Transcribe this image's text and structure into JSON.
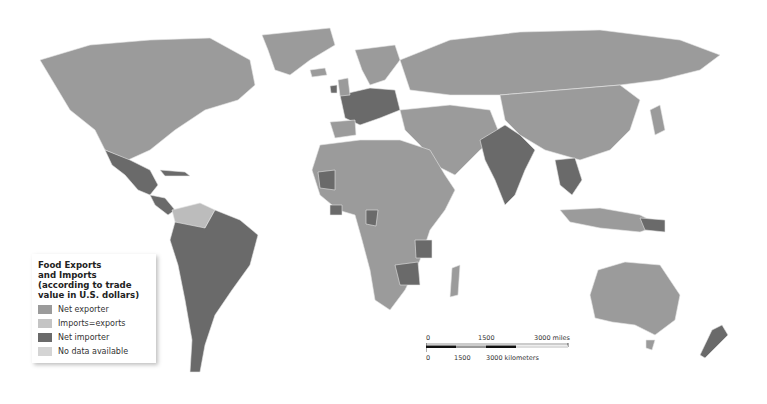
{
  "map": {
    "type": "choropleth world map",
    "colors": {
      "net_exporter": "#9b9b9b",
      "imports_equal_exports": "#c4c4c4",
      "net_importer": "#6a6a6a",
      "no_data": "#d4d4d4",
      "ocean": "#ffffff"
    }
  },
  "legend": {
    "title_line1": "Food Exports",
    "title_line2": "and Imports",
    "title_line3": "(according to trade",
    "title_line4": "value in U.S. dollars)",
    "items": [
      {
        "label": "Net exporter",
        "color": "#9b9b9b"
      },
      {
        "label": "Imports=exports",
        "color": "#c4c4c4"
      },
      {
        "label": "Net importer",
        "color": "#6a6a6a"
      },
      {
        "label": "No data available",
        "color": "#d4d4d4"
      }
    ]
  },
  "scale_bar": {
    "miles": [
      "0",
      "1500",
      "3000 miles"
    ],
    "kilometers": [
      "0",
      "1500",
      "3000 kilometers"
    ]
  }
}
